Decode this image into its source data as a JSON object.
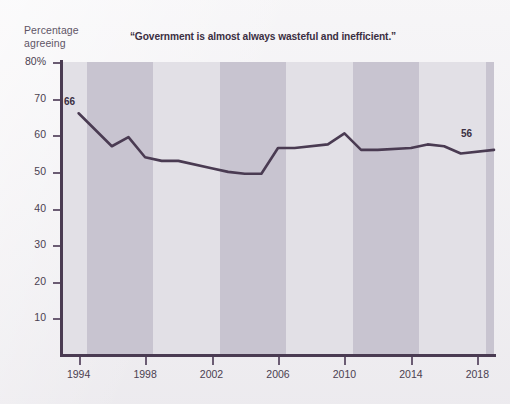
{
  "figure": {
    "y_axis_caption_line1": "Percentage",
    "y_axis_caption_line2": "agreeing",
    "title": "“Government is almost always wasteful and inefficient.”",
    "line_color": "#4a3b52",
    "band_light_color": "#e2e0e6",
    "band_dark_color": "#c8c4d0",
    "background_color": "#f2f1f3",
    "start_label": "66",
    "end_label": "56"
  },
  "chart_data": {
    "type": "line",
    "title": "“Government is almost always wasteful and inefficient.”",
    "xlabel": "",
    "ylabel": "Percentage agreeing",
    "xlim": [
      1993,
      2019
    ],
    "ylim": [
      0,
      80
    ],
    "grid": false,
    "legend": null,
    "y_ticks": [
      10,
      20,
      30,
      40,
      50,
      60,
      70,
      80
    ],
    "y_tick_labels": [
      "10",
      "20",
      "30",
      "40",
      "50",
      "60",
      "70",
      "80%"
    ],
    "x_ticks": [
      1994,
      1998,
      2002,
      2006,
      2010,
      2014,
      2018
    ],
    "x_tick_labels": [
      "1994",
      "1998",
      "2002",
      "2006",
      "2010",
      "2014",
      "2018"
    ],
    "annotations": [
      {
        "x": 1994,
        "y": 66,
        "text": "66"
      },
      {
        "x": 2019,
        "y": 56,
        "text": "56"
      }
    ],
    "x": [
      1994,
      1996,
      1997,
      1998,
      1999,
      2000,
      2002,
      2003,
      2004,
      2005,
      2006,
      2007,
      2009,
      2010,
      2011,
      2012,
      2014,
      2015,
      2016,
      2017,
      2019
    ],
    "values": [
      66,
      57,
      59.5,
      54,
      53,
      53,
      51,
      50,
      49.5,
      49.5,
      56.5,
      56.5,
      57.5,
      60.5,
      56,
      56,
      56.5,
      57.5,
      57,
      55,
      56
    ],
    "series": [
      {
        "name": "Government is almost always wasteful and inefficient",
        "points": [
          {
            "x": 1994,
            "y": 66
          },
          {
            "x": 1996,
            "y": 57
          },
          {
            "x": 1997,
            "y": 59.5
          },
          {
            "x": 1998,
            "y": 54
          },
          {
            "x": 1999,
            "y": 53
          },
          {
            "x": 2000,
            "y": 53
          },
          {
            "x": 2002,
            "y": 51
          },
          {
            "x": 2003,
            "y": 50
          },
          {
            "x": 2004,
            "y": 49.5
          },
          {
            "x": 2005,
            "y": 49.5
          },
          {
            "x": 2006,
            "y": 56.5
          },
          {
            "x": 2007,
            "y": 56.5
          },
          {
            "x": 2009,
            "y": 57.5
          },
          {
            "x": 2010,
            "y": 60.5
          },
          {
            "x": 2011,
            "y": 56
          },
          {
            "x": 2012,
            "y": 56
          },
          {
            "x": 2014,
            "y": 56.5
          },
          {
            "x": 2015,
            "y": 57.5
          },
          {
            "x": 2016,
            "y": 57
          },
          {
            "x": 2017,
            "y": 55
          },
          {
            "x": 2019,
            "y": 56
          }
        ]
      }
    ],
    "bands": [
      {
        "from": 1993,
        "to": 1994.5,
        "shade": "light"
      },
      {
        "from": 1994.5,
        "to": 1998.5,
        "shade": "dark"
      },
      {
        "from": 1998.5,
        "to": 2002.5,
        "shade": "light"
      },
      {
        "from": 2002.5,
        "to": 2006.5,
        "shade": "dark"
      },
      {
        "from": 2006.5,
        "to": 2010.5,
        "shade": "light"
      },
      {
        "from": 2010.5,
        "to": 2014.5,
        "shade": "dark"
      },
      {
        "from": 2014.5,
        "to": 2018.5,
        "shade": "light"
      },
      {
        "from": 2018.5,
        "to": 2019,
        "shade": "dark"
      }
    ]
  }
}
